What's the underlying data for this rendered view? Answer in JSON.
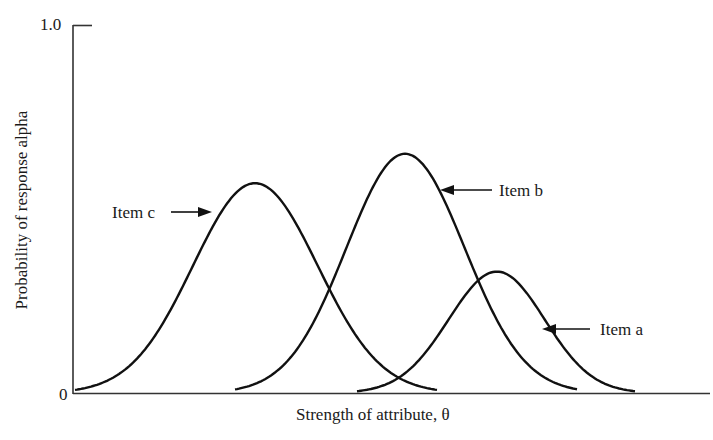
{
  "chart_data": {
    "type": "line",
    "title": "",
    "xlabel": "Strength of attribute, θ",
    "ylabel": "Probability of response alpha",
    "ylim": [
      0,
      1.0
    ],
    "yticks": [
      "0",
      "1.0"
    ],
    "grid": false,
    "legend": "inline arrow annotations",
    "series": [
      {
        "name": "Item c",
        "peak_x_px": 255,
        "peak_value": 0.57,
        "range_px": [
          75,
          437
        ]
      },
      {
        "name": "Item b",
        "peak_x_px": 405,
        "peak_value": 0.65,
        "range_px": [
          235,
          578
        ]
      },
      {
        "name": "Item a",
        "peak_x_px": 497,
        "peak_value": 0.33,
        "range_px": [
          357,
          635
        ]
      }
    ],
    "annotations": [
      {
        "text": "Item c",
        "arrow_to": "Item c curve (left flank)"
      },
      {
        "text": "Item b",
        "arrow_to": "Item b curve (right flank)"
      },
      {
        "text": "Item a",
        "arrow_to": "Item a curve (right flank)"
      }
    ]
  },
  "labels": {
    "xlabel": "Strength of attribute, θ",
    "ylabel": "Probability of response alpha",
    "ytick_top": "1.0",
    "ytick_bottom": "0",
    "item_a": "Item a",
    "item_b": "Item b",
    "item_c": "Item c"
  }
}
